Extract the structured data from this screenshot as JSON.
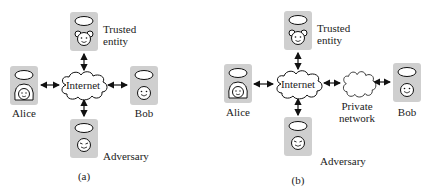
{
  "panels": [
    {
      "caption": "(a)",
      "cloud_label": "Internet",
      "nodes": {
        "trusted": {
          "label_line1": "Trusted",
          "label_line2": "entity",
          "face": "bear-face-icon"
        },
        "alice": {
          "label": "Alice",
          "face": "girl-face-icon"
        },
        "bob": {
          "label": "Bob",
          "face": "smiley-face-icon"
        },
        "adversary": {
          "label": "Adversary",
          "face": "sly-face-icon"
        }
      }
    },
    {
      "caption": "(b)",
      "cloud_label": "Internet",
      "private_cloud_label_line1": "Private",
      "private_cloud_label_line2": "network",
      "nodes": {
        "trusted": {
          "label_line1": "Trusted",
          "label_line2": "entity",
          "face": "bear-face-icon"
        },
        "alice": {
          "label": "Alice",
          "face": "girl-face-icon"
        },
        "bob": {
          "label": "Bob",
          "face": "smiley-face-icon"
        },
        "adversary": {
          "label": "Adversary",
          "face": "sly-face-icon"
        }
      }
    }
  ],
  "colors": {
    "box": "#cfcfcf",
    "stroke": "#111111"
  }
}
